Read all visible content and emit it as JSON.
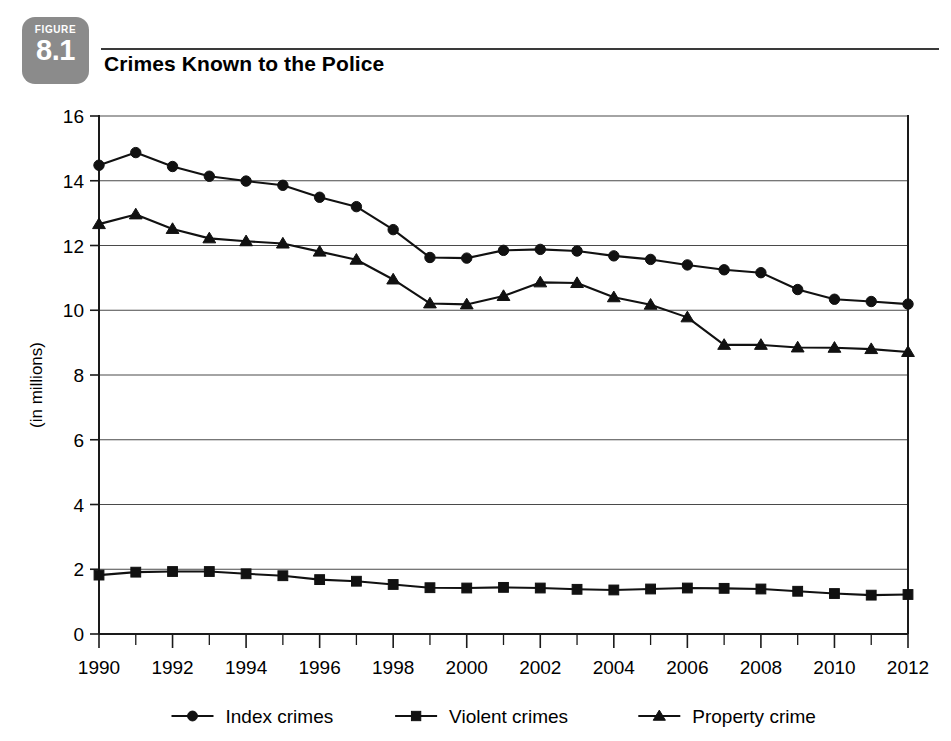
{
  "figure": {
    "badge_kicker": "FIGURE",
    "badge_number": "8.1",
    "title": "Crimes Known to the Police"
  },
  "chart_data": {
    "type": "line",
    "title": "Crimes Known to the Police",
    "xlabel": "",
    "ylabel": "(in millions)",
    "xlim": [
      1990,
      2012
    ],
    "ylim": [
      0,
      16
    ],
    "ytick_step": 2,
    "yticks": [
      0,
      2,
      4,
      6,
      8,
      10,
      12,
      14,
      16
    ],
    "ytick_labels": [
      "0",
      "2",
      "4",
      "6",
      "8",
      "10",
      "12",
      "14",
      "16"
    ],
    "x": [
      1990,
      1991,
      1992,
      1993,
      1994,
      1995,
      1996,
      1997,
      1998,
      1999,
      2000,
      2001,
      2002,
      2003,
      2004,
      2005,
      2006,
      2007,
      2008,
      2009,
      2010,
      2011,
      2012
    ],
    "xtick_labels": [
      "1990",
      "1992",
      "1994",
      "1996",
      "1998",
      "2000",
      "2002",
      "2004",
      "2006",
      "2008",
      "2010",
      "2012"
    ],
    "xtick_values": [
      1990,
      1992,
      1994,
      1996,
      1998,
      2000,
      2002,
      2004,
      2006,
      2008,
      2010,
      2012
    ],
    "xtick_minor_values": [
      1991,
      1993,
      1995,
      1997,
      1999,
      2001,
      2003,
      2005,
      2007,
      2009,
      2011
    ],
    "grid": "horizontal",
    "legend_position": "bottom",
    "series": [
      {
        "name": "Index crimes",
        "marker": "circle",
        "color": "#111111",
        "values": [
          14.48,
          14.87,
          14.44,
          14.14,
          13.99,
          13.86,
          13.49,
          13.2,
          12.49,
          11.63,
          11.61,
          11.85,
          11.88,
          11.83,
          11.68,
          11.57,
          11.4,
          11.25,
          11.16,
          10.64,
          10.34,
          10.27,
          10.19
        ]
      },
      {
        "name": "Violent crimes",
        "marker": "square",
        "color": "#111111",
        "values": [
          1.82,
          1.91,
          1.93,
          1.93,
          1.86,
          1.8,
          1.68,
          1.63,
          1.53,
          1.43,
          1.42,
          1.44,
          1.42,
          1.38,
          1.36,
          1.39,
          1.42,
          1.41,
          1.39,
          1.32,
          1.25,
          1.2,
          1.22
        ]
      },
      {
        "name": "Property crime",
        "marker": "triangle",
        "color": "#111111",
        "values": [
          12.66,
          12.96,
          12.51,
          12.22,
          12.13,
          12.06,
          11.81,
          11.56,
          10.95,
          10.21,
          10.18,
          10.44,
          10.86,
          10.84,
          10.4,
          10.17,
          9.78,
          8.93,
          8.93,
          8.85,
          8.84,
          8.8,
          8.71
        ]
      }
    ]
  },
  "legend": {
    "items": [
      {
        "label": "Index crimes",
        "marker": "circle"
      },
      {
        "label": "Violent crimes",
        "marker": "square"
      },
      {
        "label": "Property crime",
        "marker": "triangle"
      }
    ]
  }
}
